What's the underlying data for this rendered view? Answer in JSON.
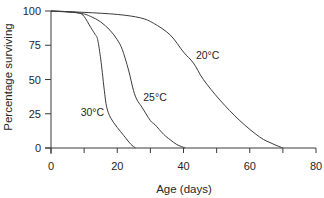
{
  "chart_data": {
    "type": "line",
    "title": "",
    "xlabel": "Age (days)",
    "ylabel": "Percentage surviving",
    "xlim": [
      0,
      80
    ],
    "ylim": [
      0,
      100
    ],
    "xticks": [
      0,
      10,
      20,
      30,
      40,
      50,
      60,
      70,
      80
    ],
    "xtick_labels": [
      "0",
      "",
      "20",
      "",
      "40",
      "",
      "60",
      "",
      "80"
    ],
    "yticks": [
      0,
      25,
      50,
      75,
      100
    ],
    "ytick_labels": [
      "0",
      "25",
      "50",
      "75",
      "100"
    ],
    "grid": false,
    "legend": "none (series labelled inline)",
    "series": [
      {
        "name": "30°C",
        "x": [
          0,
          5,
          8.5,
          10,
          12,
          13.3,
          14.1,
          15,
          15.5,
          16.1,
          16.8,
          18,
          20,
          22,
          24,
          25.5
        ],
        "y": [
          100,
          99.5,
          98.5,
          96,
          88,
          83,
          79,
          65,
          55,
          42,
          30,
          22,
          15,
          9,
          3,
          0
        ]
      },
      {
        "name": "25°C",
        "x": [
          0,
          8.5,
          12,
          15,
          17.8,
          20,
          21.5,
          23.4,
          24.9,
          26,
          27.4,
          30,
          31.4,
          34,
          36,
          38,
          40.5
        ],
        "y": [
          100,
          98.5,
          96,
          92,
          86,
          79,
          72,
          57,
          42,
          35,
          30,
          20,
          17,
          10,
          6,
          2.5,
          0
        ]
      },
      {
        "name": "20°C",
        "x": [
          0,
          10,
          20,
          27,
          31,
          36,
          40,
          43,
          46,
          51,
          57,
          63,
          67,
          70
        ],
        "y": [
          100,
          99,
          97.5,
          95,
          91,
          82.5,
          70,
          62,
          50,
          35,
          20,
          8,
          3,
          0
        ]
      }
    ],
    "annotations": [
      {
        "text": "30°C",
        "x": 12.5,
        "y": 26
      },
      {
        "text": "25°C",
        "x": 31.4,
        "y": 37
      },
      {
        "text": "20°C",
        "x": 47.3,
        "y": 68
      }
    ],
    "colors": {
      "line": "#3c3c3c",
      "axis": "#3a3a3a",
      "text": "#262626",
      "background": "#ffffff"
    }
  }
}
